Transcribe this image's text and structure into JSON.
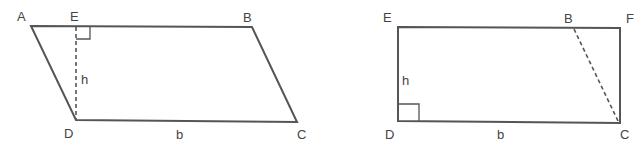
{
  "figures": [
    {
      "name": "parallelogram",
      "labels": {
        "A": "A",
        "E": "E",
        "B": "B",
        "D": "D",
        "C": "C",
        "h": "h",
        "b": "b"
      },
      "vertices": {
        "A": [
          31,
          26
        ],
        "E": [
          76,
          26
        ],
        "B": [
          252,
          27
        ],
        "C": [
          297,
          122
        ],
        "D": [
          76,
          120
        ]
      },
      "height_line": "dashed E-D",
      "right_angle_at": "E"
    },
    {
      "name": "rectangle",
      "labels": {
        "E": "E",
        "B": "B",
        "F": "F",
        "D": "D",
        "C": "C",
        "h": "h",
        "b": "b"
      },
      "vertices": {
        "E": [
          398,
          27
        ],
        "B": [
          574,
          28
        ],
        "F": [
          620,
          28
        ],
        "C": [
          620,
          123
        ],
        "D": [
          398,
          121
        ]
      },
      "dashed_line": "B-C",
      "right_angle_at": "D"
    }
  ],
  "colors": {
    "stroke": "#555555",
    "text": "#444444",
    "background": "#ffffff"
  }
}
